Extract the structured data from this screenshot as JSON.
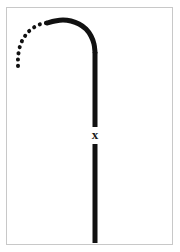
{
  "figure": {
    "background_color": "#ffffff",
    "frame_color": "#c8c8c8",
    "stroke_color": "#111111",
    "labels": {
      "point_x": "x"
    },
    "elements": {
      "dotted_arc_name": "dotted-arc-branch",
      "solid_arc_name": "solid-arc-bend",
      "upper_stem_name": "upper-vertical-stem",
      "lower_stem_name": "lower-vertical-stem"
    }
  },
  "chart_data": {
    "type": "line",
    "title": "",
    "xlabel": "",
    "ylabel": "",
    "grid": false,
    "legend": null,
    "xlim": [
      0,
      180
    ],
    "ylim": [
      252,
      0
    ],
    "annotations": [
      {
        "text": "x",
        "x": 95,
        "y": 135,
        "name": "point-label-x"
      }
    ],
    "series": [
      {
        "name": "dotted-arc-branch",
        "style": "dotted",
        "linewidth": 4,
        "color": "#111111",
        "points": [
          [
            46,
            23
          ],
          [
            41,
            24
          ],
          [
            36,
            26
          ],
          [
            32,
            29
          ],
          [
            28,
            32
          ],
          [
            25,
            36
          ],
          [
            22,
            41
          ],
          [
            20,
            46
          ],
          [
            19,
            51
          ],
          [
            18,
            56
          ],
          [
            18,
            61
          ],
          [
            18,
            66
          ],
          [
            18,
            71
          ]
        ]
      },
      {
        "name": "solid-arc-bend",
        "style": "solid",
        "linewidth": 5,
        "color": "#111111",
        "points": [
          [
            47,
            23
          ],
          [
            55,
            21
          ],
          [
            63,
            20
          ],
          [
            71,
            21
          ],
          [
            79,
            24
          ],
          [
            86,
            29
          ],
          [
            91,
            36
          ],
          [
            94,
            44
          ],
          [
            95,
            52
          ]
        ]
      },
      {
        "name": "upper-vertical-stem",
        "style": "solid",
        "linewidth": 5,
        "color": "#111111",
        "points": [
          [
            95,
            52
          ],
          [
            95,
            127
          ]
        ]
      },
      {
        "name": "lower-vertical-stem",
        "style": "solid",
        "linewidth": 5,
        "color": "#111111",
        "points": [
          [
            95,
            144
          ],
          [
            95,
            243
          ]
        ]
      }
    ]
  }
}
